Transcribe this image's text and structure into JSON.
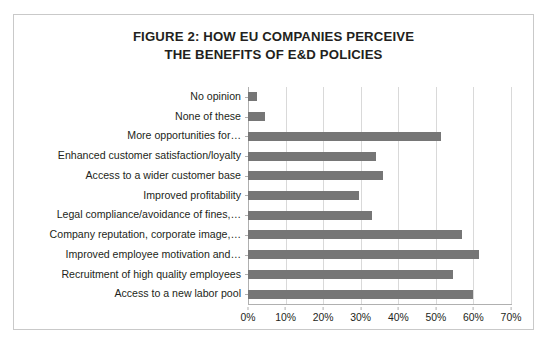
{
  "figure": {
    "title_line_1": "FIGURE 2:  HOW EU COMPANIES PERCEIVE",
    "title_line_2": "THE BENEFITS OF E&D POLICIES",
    "border_color": "#c9c9c9"
  },
  "chart_data": {
    "type": "bar",
    "orientation": "horizontal",
    "title": "FIGURE 2:  HOW EU COMPANIES PERCEIVE THE BENEFITS OF E&D POLICIES",
    "xlabel": "",
    "ylabel": "",
    "xlim": [
      0,
      70
    ],
    "grid": true,
    "legend": false,
    "bar_color": "#767676",
    "categories": [
      "No opinion",
      "None of these",
      "More opportunities for…",
      "Enhanced customer satisfaction/loyalty",
      "Access to a wider customer base",
      "Improved profitability",
      "Legal compliance/avoidance of fines,…",
      "Company reputation, corporate image,…",
      "Improved employee motivation and…",
      "Recruitment of high quality employees",
      "Access to a new labor pool"
    ],
    "values": [
      2.5,
      4.5,
      51.5,
      34,
      36,
      29.5,
      33,
      57,
      61.5,
      54.5,
      60
    ],
    "value_labels": [
      "2.5%",
      "4.5%",
      "51.5%",
      "34%",
      "36%",
      "29.5%",
      "33%",
      "57%",
      "61.5%",
      "54.5%",
      "60%"
    ],
    "x_ticks": [
      0,
      10,
      20,
      30,
      40,
      50,
      60,
      70
    ],
    "x_tick_labels": [
      "0%",
      "10%",
      "20%",
      "30%",
      "40%",
      "50%",
      "60%",
      "70%"
    ]
  }
}
